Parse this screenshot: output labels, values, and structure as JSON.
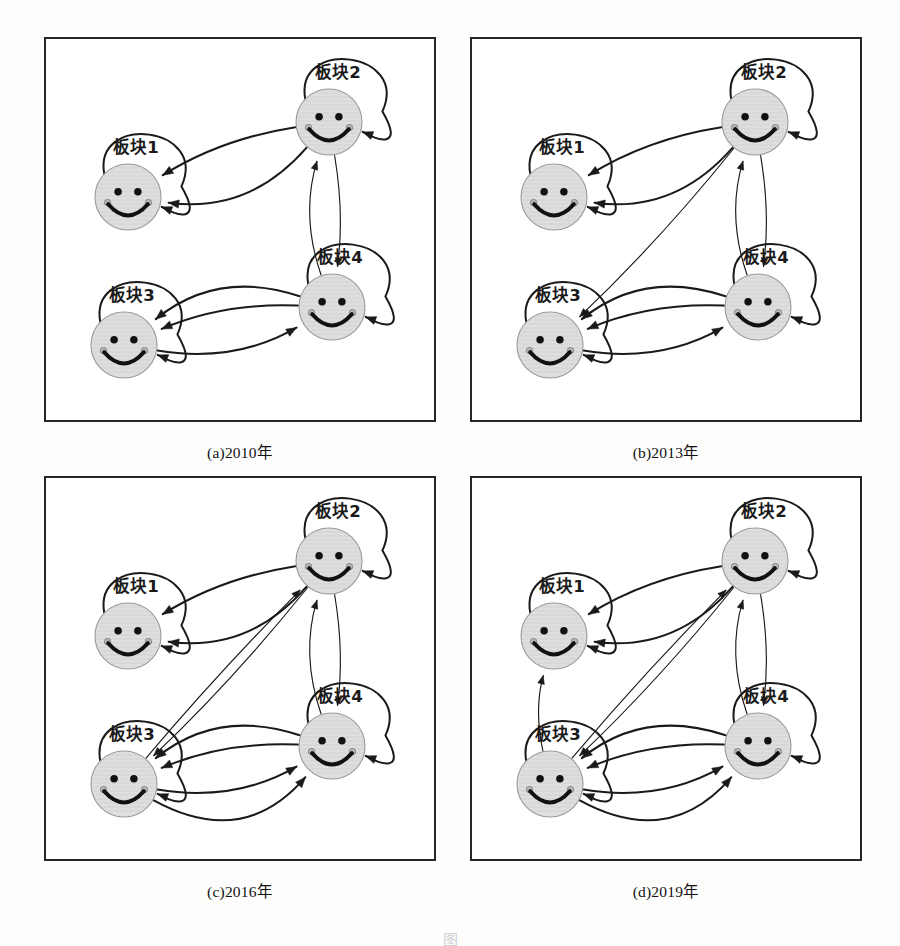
{
  "figure": {
    "title_partial": "图",
    "background_color": "#ffffff",
    "ink_color": "#1a1a1a",
    "node_fill": "#dedede",
    "node_stroke": "#9a9a9a",
    "panel_border_color": "#262626"
  },
  "node_labels": {
    "n1": "板块1",
    "n2": "板块2",
    "n3": "板块3",
    "n4": "板块4"
  },
  "panels": [
    {
      "id": "a",
      "caption": "(a)2010年",
      "year": "2010",
      "nodes": [
        {
          "key": "n1",
          "label": "板块1",
          "cx": 84,
          "cy": 160,
          "r": 33,
          "label_x": 92,
          "label_y": 116
        },
        {
          "key": "n2",
          "label": "板块2",
          "cx": 285,
          "cy": 85,
          "r": 33,
          "label_x": 294,
          "label_y": 41
        },
        {
          "key": "n3",
          "label": "板块3",
          "cx": 80,
          "cy": 308,
          "r": 33,
          "label_x": 88,
          "label_y": 264
        },
        {
          "key": "n4",
          "label": "板块4",
          "cx": 288,
          "cy": 270,
          "r": 33,
          "label_x": 296,
          "label_y": 226
        }
      ],
      "edges": [
        {
          "from": "n1",
          "to": "n1",
          "type": "self",
          "side": "right"
        },
        {
          "from": "n2",
          "to": "n2",
          "type": "self",
          "side": "right"
        },
        {
          "from": "n3",
          "to": "n3",
          "type": "self",
          "side": "right"
        },
        {
          "from": "n4",
          "to": "n4",
          "type": "self",
          "side": "right"
        },
        {
          "from": "n2",
          "to": "n1",
          "type": "arc",
          "bow": -58,
          "weight": "thick"
        },
        {
          "from": "n2",
          "to": "n1",
          "type": "arc",
          "bow": 22,
          "weight": "thick"
        },
        {
          "from": "n2",
          "to": "n4",
          "type": "arc",
          "bow": -14,
          "weight": "thin"
        },
        {
          "from": "n4",
          "to": "n2",
          "type": "arc",
          "bow": -30,
          "weight": "thin"
        },
        {
          "from": "n4",
          "to": "n3",
          "type": "arc",
          "bow": 24,
          "weight": "thick"
        },
        {
          "from": "n4",
          "to": "n3",
          "type": "arc",
          "bow": 58,
          "weight": "thick"
        },
        {
          "from": "n3",
          "to": "n4",
          "type": "arc",
          "bow": 38,
          "weight": "thick"
        }
      ]
    },
    {
      "id": "b",
      "caption": "(b)2013年",
      "year": "2013",
      "nodes": [
        {
          "key": "n1",
          "label": "板块1",
          "cx": 84,
          "cy": 160,
          "r": 33,
          "label_x": 92,
          "label_y": 116
        },
        {
          "key": "n2",
          "label": "板块2",
          "cx": 285,
          "cy": 85,
          "r": 33,
          "label_x": 294,
          "label_y": 41
        },
        {
          "key": "n3",
          "label": "板块3",
          "cx": 80,
          "cy": 308,
          "r": 33,
          "label_x": 88,
          "label_y": 264
        },
        {
          "key": "n4",
          "label": "板块4",
          "cx": 288,
          "cy": 270,
          "r": 33,
          "label_x": 296,
          "label_y": 226
        }
      ],
      "edges": [
        {
          "from": "n1",
          "to": "n1",
          "type": "self",
          "side": "right"
        },
        {
          "from": "n2",
          "to": "n2",
          "type": "self",
          "side": "right"
        },
        {
          "from": "n3",
          "to": "n3",
          "type": "self",
          "side": "right"
        },
        {
          "from": "n4",
          "to": "n4",
          "type": "self",
          "side": "right"
        },
        {
          "from": "n2",
          "to": "n1",
          "type": "arc",
          "bow": -58,
          "weight": "thick"
        },
        {
          "from": "n2",
          "to": "n1",
          "type": "arc",
          "bow": 22,
          "weight": "thick"
        },
        {
          "from": "n2",
          "to": "n3",
          "type": "arc",
          "bow": -10,
          "weight": "thin"
        },
        {
          "from": "n2",
          "to": "n4",
          "type": "arc",
          "bow": -14,
          "weight": "thin"
        },
        {
          "from": "n4",
          "to": "n2",
          "type": "arc",
          "bow": -30,
          "weight": "thin"
        },
        {
          "from": "n4",
          "to": "n3",
          "type": "arc",
          "bow": 24,
          "weight": "thick"
        },
        {
          "from": "n4",
          "to": "n3",
          "type": "arc",
          "bow": 58,
          "weight": "thick"
        },
        {
          "from": "n3",
          "to": "n4",
          "type": "arc",
          "bow": 38,
          "weight": "thick"
        }
      ]
    },
    {
      "id": "c",
      "caption": "(c)2016年",
      "year": "2016",
      "nodes": [
        {
          "key": "n1",
          "label": "板块1",
          "cx": 84,
          "cy": 160,
          "r": 33,
          "label_x": 92,
          "label_y": 116
        },
        {
          "key": "n2",
          "label": "板块2",
          "cx": 285,
          "cy": 85,
          "r": 33,
          "label_x": 294,
          "label_y": 41
        },
        {
          "key": "n3",
          "label": "板块3",
          "cx": 80,
          "cy": 308,
          "r": 33,
          "label_x": 88,
          "label_y": 264
        },
        {
          "key": "n4",
          "label": "板块4",
          "cx": 288,
          "cy": 270,
          "r": 33,
          "label_x": 296,
          "label_y": 226
        }
      ],
      "edges": [
        {
          "from": "n1",
          "to": "n1",
          "type": "self",
          "side": "right"
        },
        {
          "from": "n2",
          "to": "n2",
          "type": "self",
          "side": "right"
        },
        {
          "from": "n3",
          "to": "n3",
          "type": "self",
          "side": "right"
        },
        {
          "from": "n4",
          "to": "n4",
          "type": "self",
          "side": "right"
        },
        {
          "from": "n2",
          "to": "n1",
          "type": "arc",
          "bow": -58,
          "weight": "thick"
        },
        {
          "from": "n2",
          "to": "n1",
          "type": "arc",
          "bow": 22,
          "weight": "thick"
        },
        {
          "from": "n3",
          "to": "n2",
          "type": "arc",
          "bow": -6,
          "weight": "thin"
        },
        {
          "from": "n2",
          "to": "n3",
          "type": "arc",
          "bow": -10,
          "weight": "thin"
        },
        {
          "from": "n2",
          "to": "n4",
          "type": "arc",
          "bow": -14,
          "weight": "thin"
        },
        {
          "from": "n4",
          "to": "n2",
          "type": "arc",
          "bow": -30,
          "weight": "thin"
        },
        {
          "from": "n4",
          "to": "n3",
          "type": "arc",
          "bow": 24,
          "weight": "thick"
        },
        {
          "from": "n4",
          "to": "n3",
          "type": "arc",
          "bow": 58,
          "weight": "thick"
        },
        {
          "from": "n3",
          "to": "n4",
          "type": "arc",
          "bow": 38,
          "weight": "thick"
        },
        {
          "from": "n3",
          "to": "n4",
          "type": "arc",
          "bow": 86,
          "weight": "thick"
        }
      ]
    },
    {
      "id": "d",
      "caption": "(d)2019年",
      "year": "2019",
      "nodes": [
        {
          "key": "n1",
          "label": "板块1",
          "cx": 84,
          "cy": 160,
          "r": 33,
          "label_x": 92,
          "label_y": 116
        },
        {
          "key": "n2",
          "label": "板块2",
          "cx": 285,
          "cy": 85,
          "r": 33,
          "label_x": 294,
          "label_y": 41
        },
        {
          "key": "n3",
          "label": "板块3",
          "cx": 80,
          "cy": 308,
          "r": 33,
          "label_x": 88,
          "label_y": 264
        },
        {
          "key": "n4",
          "label": "板块4",
          "cx": 288,
          "cy": 270,
          "r": 33,
          "label_x": 296,
          "label_y": 226
        }
      ],
      "edges": [
        {
          "from": "n1",
          "to": "n1",
          "type": "self",
          "side": "right"
        },
        {
          "from": "n2",
          "to": "n2",
          "type": "self",
          "side": "right"
        },
        {
          "from": "n3",
          "to": "n3",
          "type": "self",
          "side": "right"
        },
        {
          "from": "n4",
          "to": "n4",
          "type": "self",
          "side": "right"
        },
        {
          "from": "n2",
          "to": "n1",
          "type": "arc",
          "bow": -58,
          "weight": "thick"
        },
        {
          "from": "n2",
          "to": "n1",
          "type": "arc",
          "bow": 22,
          "weight": "thick"
        },
        {
          "from": "n3",
          "to": "n1",
          "type": "arc",
          "bow": -18,
          "weight": "thin"
        },
        {
          "from": "n3",
          "to": "n2",
          "type": "arc",
          "bow": -6,
          "weight": "thin"
        },
        {
          "from": "n2",
          "to": "n3",
          "type": "arc",
          "bow": -10,
          "weight": "thin"
        },
        {
          "from": "n2",
          "to": "n4",
          "type": "arc",
          "bow": -14,
          "weight": "thin"
        },
        {
          "from": "n4",
          "to": "n2",
          "type": "arc",
          "bow": -30,
          "weight": "thin"
        },
        {
          "from": "n4",
          "to": "n3",
          "type": "arc",
          "bow": 24,
          "weight": "thick"
        },
        {
          "from": "n4",
          "to": "n3",
          "type": "arc",
          "bow": 58,
          "weight": "thick"
        },
        {
          "from": "n3",
          "to": "n4",
          "type": "arc",
          "bow": 38,
          "weight": "thick"
        },
        {
          "from": "n3",
          "to": "n4",
          "type": "arc",
          "bow": 86,
          "weight": "thick"
        }
      ]
    }
  ],
  "layout": {
    "panel_w": 392,
    "panel_h": 385,
    "positions": [
      {
        "left": 44,
        "top": 37
      },
      {
        "left": 470,
        "top": 37
      },
      {
        "left": 44,
        "top": 476
      },
      {
        "left": 470,
        "top": 476
      }
    ],
    "caption_offset": 18
  }
}
